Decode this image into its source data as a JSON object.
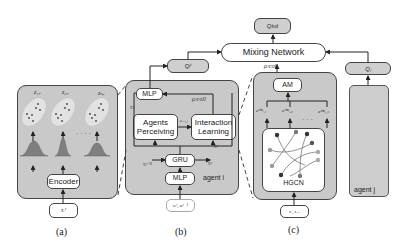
{
  "panel_a": {
    "caption": "(a)",
    "encoder_label": "Encoder",
    "input_label": "τᵢᵗ",
    "cluster_labels": [
      "z₁,ᵢ",
      "z₂,ᵢ",
      "zₙ,ᵢ"
    ],
    "ellipsis": "· · · ·"
  },
  "panel_b": {
    "caption": "(b)",
    "q_label": "Qᵢᵗ",
    "mlp_top_label": "MLP",
    "agents_perceiving_label": "Agents Perceiving",
    "interaction_learning_label": "Interaction Learning",
    "gru_label": "GRU",
    "mlp_bottom_label": "MLP",
    "agent_label": "agent i",
    "input_label": "oᵢᵗ, aᵢᵗ⁻¹",
    "tau_prev_label": "τᵢᵗ⁻¹",
    "tau_label_gru": "τᵢᵗ",
    "tau_label_il": "τᵢᵗ",
    "tau_label_mlp": "τᵢᵗ",
    "z_label": "z₋ᵢ,ᵢ",
    "rho_label": "ρᵢᵗcoll"
  },
  "panel_c": {
    "caption": "(c)",
    "am_label": "AM",
    "hgcn_label": "HGCN",
    "rho_label": "ρᵢᵗcoll",
    "input_label": "τᵢ, z₋ᵢ",
    "emb_labels": [
      "eᵍʰⁿᵢ,₁",
      "eᵍʰⁿᵢ,₂",
      "eᵍʰⁿᵢ,ₙ"
    ],
    "ellipsis": "· · ·"
  },
  "top": {
    "mixing_network_label": "Mixing Network",
    "q_tot_label": "Qtot"
  },
  "agent_j": {
    "q_label": "Qⱼ",
    "agent_label": "agent j"
  },
  "colors": {
    "panel_fill": "#c9c9c9",
    "outline": "#444444",
    "distribution": "#7f7f7f",
    "node_dark": "#333333",
    "node_light": "#9a9a9a"
  }
}
